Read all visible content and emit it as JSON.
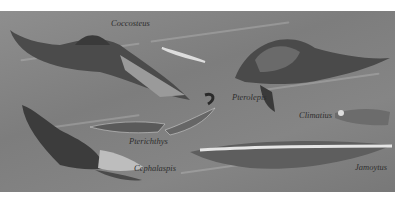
{
  "illustration": {
    "subject": "Prehistoric fish",
    "labels": [
      {
        "name": "Coccosteus",
        "x": 111,
        "y": 18
      },
      {
        "name": "Pterolepis",
        "x": 232,
        "y": 92
      },
      {
        "name": "Climatius",
        "x": 299,
        "y": 110
      },
      {
        "name": "Pterichthys",
        "x": 129,
        "y": 136
      },
      {
        "name": "Cephalaspis",
        "x": 134,
        "y": 163
      },
      {
        "name": "Jamoytus",
        "x": 358,
        "y": 162
      }
    ]
  }
}
